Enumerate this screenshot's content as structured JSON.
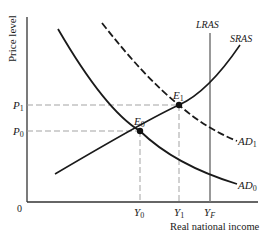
{
  "diagram": {
    "title": "",
    "y_axis_label": "Price level",
    "x_axis_label": "Real national income",
    "origin_label": "0",
    "curves": [
      {
        "id": "AD0",
        "label": "AD",
        "sub": "0",
        "style": "solid"
      },
      {
        "id": "AD1",
        "label": "AD",
        "sub": "1",
        "style": "dashed"
      },
      {
        "id": "SRAS",
        "label": "SRAS",
        "style": "solid"
      },
      {
        "id": "LRAS",
        "label": "LRAS",
        "style": "vertical"
      }
    ],
    "points": [
      {
        "id": "E0",
        "label": "E",
        "sub": "0"
      },
      {
        "id": "E1",
        "label": "E",
        "sub": "1"
      }
    ],
    "y_ticks": [
      {
        "label": "P",
        "sub": "1"
      },
      {
        "label": "P",
        "sub": "0"
      }
    ],
    "x_ticks": [
      {
        "label": "Y",
        "sub": "0"
      },
      {
        "label": "Y",
        "sub": "1"
      },
      {
        "label": "Y",
        "sub": "F"
      }
    ],
    "colors": {
      "curve": "#1a1a1a",
      "lras": "#777777",
      "guide": "#999999"
    }
  }
}
